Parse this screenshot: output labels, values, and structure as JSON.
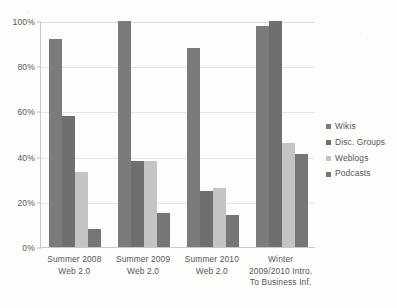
{
  "chart_data": {
    "type": "bar",
    "title": "",
    "xlabel": "",
    "ylabel": "",
    "ylim": [
      0,
      100
    ],
    "ytick_labels": [
      "0%",
      "20%",
      "40%",
      "60%",
      "80%",
      "100%"
    ],
    "ytick_values": [
      0,
      20,
      40,
      60,
      80,
      100
    ],
    "grid": true,
    "legend_position": "right",
    "categories": [
      "Summer 2008\nWeb 2.0",
      "Summer 2009\nWeb 2.0",
      "Summer 2010\nWeb 2.0",
      "Winter 2009/2010 Intro. To Business Inf."
    ],
    "category_lines": [
      [
        "Summer 2008",
        "Web 2.0"
      ],
      [
        "Summer 2009",
        "Web 2.0"
      ],
      [
        "Summer 2010",
        "Web 2.0"
      ],
      [
        "Winter",
        "2009/2010 Intro.",
        "To Business Inf."
      ]
    ],
    "series": [
      {
        "name": "Wikis",
        "color": "#7b7b7b",
        "values": [
          92,
          100,
          88,
          98
        ]
      },
      {
        "name": "Disc. Groups",
        "color": "#6f6f6f",
        "values": [
          58,
          38,
          25,
          100
        ]
      },
      {
        "name": "Weblogs",
        "color": "#c4c4c4",
        "values": [
          33,
          38,
          26,
          46
        ]
      },
      {
        "name": "Podcasts",
        "color": "#767676",
        "values": [
          8,
          15,
          14,
          41
        ]
      }
    ]
  },
  "legend": {
    "items": [
      {
        "label": "Wikis"
      },
      {
        "label": "Disc. Groups"
      },
      {
        "label": "Weblogs"
      },
      {
        "label": "Podcasts"
      }
    ]
  }
}
